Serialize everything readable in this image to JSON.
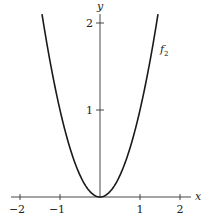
{
  "chart_data": {
    "type": "line",
    "title": "",
    "xlabel": "x",
    "ylabel": "y",
    "xlim": [
      -2.2,
      2.2
    ],
    "ylim": [
      0,
      2.2
    ],
    "grid": false,
    "x_ticks": [
      -2,
      -1,
      1,
      2
    ],
    "x_tick_labels": [
      "−2",
      "−1",
      "1",
      "2"
    ],
    "y_ticks": [
      1,
      2
    ],
    "y_tick_labels": [
      "1",
      "2"
    ],
    "series": [
      {
        "name": "f₂",
        "label_main": "f",
        "label_sub": "2",
        "function": "x^2",
        "x": [
          -1.45,
          -1.25,
          -1.0,
          -0.75,
          -0.5,
          -0.25,
          0,
          0.25,
          0.5,
          0.75,
          1.0,
          1.25,
          1.45
        ],
        "values": [
          2.1,
          1.5625,
          1.0,
          0.5625,
          0.25,
          0.0625,
          0,
          0.0625,
          0.25,
          0.5625,
          1.0,
          1.5625,
          2.1
        ]
      }
    ],
    "annotations": [
      {
        "text": "f₂",
        "x": 1.55,
        "y": 1.7
      }
    ]
  },
  "colors": {
    "curve": "#1a1a1a",
    "axis": "#333333"
  }
}
